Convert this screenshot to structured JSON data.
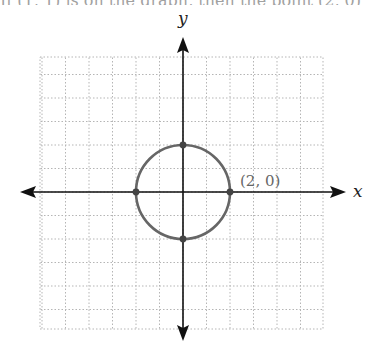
{
  "clipped_header_text": "If (1, 1) is on the graph, then the point (2, 0)",
  "graph": {
    "x_axis_label": "x",
    "y_axis_label": "y",
    "grid": {
      "x_min": -6,
      "x_max": 6,
      "y_min": -6,
      "y_max": 6,
      "step": 1,
      "style": "dotted"
    },
    "shape": {
      "type": "circle",
      "center": [
        0,
        0
      ],
      "radius": 2,
      "color": "#666666"
    },
    "points": [
      {
        "x": 2,
        "y": 0,
        "label": "(2, 0)"
      },
      {
        "x": -2,
        "y": 0,
        "label": ""
      },
      {
        "x": 0,
        "y": 2,
        "label": ""
      },
      {
        "x": 0,
        "y": -2,
        "label": ""
      }
    ],
    "axis_color": "#111111",
    "grid_color": "#b5b5b5"
  }
}
